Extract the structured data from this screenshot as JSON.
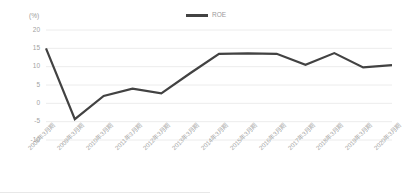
{
  "chart_data": {
    "type": "line",
    "title": "",
    "subtitle": "",
    "xlabel": "",
    "ylabel": "(%)",
    "unit_label": "(%)",
    "ylim": [
      -10,
      20
    ],
    "yticks": [
      20,
      15,
      10,
      5,
      0,
      -5,
      -10
    ],
    "ytick_labels": [
      "20",
      "15",
      "10",
      "5",
      "0",
      "-5",
      "-10"
    ],
    "grid": true,
    "grid_axis": "y",
    "legend_position": "top-center",
    "legend": [
      "ROE"
    ],
    "categories": [
      "2008年3月期",
      "2009年3月期",
      "2010年3月期",
      "2011年3月期",
      "2012年3月期",
      "2013年3月期",
      "2014年3月期",
      "2015年3月期",
      "2016年3月期",
      "2017年3月期",
      "2018年3月期",
      "2019年3月期",
      "2020年3月期"
    ],
    "series": [
      {
        "name": "ROE",
        "color": "#424242",
        "values": [
          15.0,
          -4.3,
          2.0,
          4.0,
          2.7,
          8.2,
          13.5,
          13.6,
          13.5,
          10.5,
          13.7,
          9.8,
          10.4
        ]
      }
    ]
  },
  "colors": {
    "line": "#424242",
    "grid": "#ececec",
    "tick_text": "#a2a2a2",
    "background": "#ffffff"
  }
}
